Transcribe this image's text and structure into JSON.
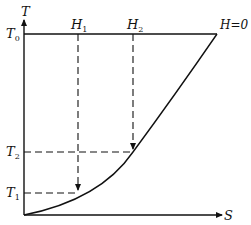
{
  "diagram": {
    "type": "T-S diagram",
    "axes": {
      "y_label": "T",
      "x_label": "S"
    },
    "labels": {
      "T0": {
        "base": "T",
        "sub": "0"
      },
      "T1": {
        "base": "T",
        "sub": "1"
      },
      "T2": {
        "base": "T",
        "sub": "2"
      },
      "H1": {
        "base": "H",
        "sub": "1"
      },
      "H2": {
        "base": "H",
        "sub": "2"
      },
      "H0": "H=0"
    },
    "lines": {
      "top_line": "horizontal solid line at T0",
      "curve": "rising curve from origin to H=0 at T0",
      "dashed_vertical": [
        "H1 down to curve at T1",
        "H2 down to curve at T2"
      ],
      "dashed_horizontal": [
        "T2 to curve",
        "T1 to curve"
      ]
    },
    "colors": {
      "ink": "#111111",
      "background": "#ffffff"
    }
  }
}
